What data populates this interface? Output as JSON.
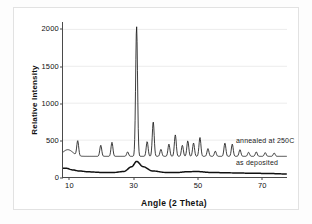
{
  "chart_data": {
    "type": "line",
    "title": "",
    "xlabel": "Angle (2 Theta)",
    "ylabel": "Relative Intensity",
    "xlim": [
      8,
      78
    ],
    "ylim": [
      0,
      2100
    ],
    "xticks": [
      10,
      30,
      50,
      70
    ],
    "yticks": [
      0,
      500,
      1000,
      1500,
      2000
    ],
    "grid": "horizontal-faint",
    "legend_position": "inline-right-annotations",
    "series": [
      {
        "name": "annealed at 250C",
        "baseline": 280,
        "color": "#1a1a1a",
        "peaks": [
          {
            "x": 12.6,
            "height": 200
          },
          {
            "x": 19.8,
            "height": 150
          },
          {
            "x": 23.3,
            "height": 190
          },
          {
            "x": 28.2,
            "height": 60
          },
          {
            "x": 31.0,
            "height": 1760
          },
          {
            "x": 34.3,
            "height": 200
          },
          {
            "x": 36.2,
            "height": 470
          },
          {
            "x": 38.6,
            "height": 95
          },
          {
            "x": 41.1,
            "height": 165
          },
          {
            "x": 43.1,
            "height": 290
          },
          {
            "x": 45.3,
            "height": 150
          },
          {
            "x": 47.0,
            "height": 210
          },
          {
            "x": 48.8,
            "height": 180
          },
          {
            "x": 50.8,
            "height": 255
          },
          {
            "x": 53.3,
            "height": 105
          },
          {
            "x": 55.6,
            "height": 70
          },
          {
            "x": 58.6,
            "height": 180
          },
          {
            "x": 60.9,
            "height": 165
          },
          {
            "x": 63.3,
            "height": 90
          },
          {
            "x": 66.0,
            "height": 55
          },
          {
            "x": 68.4,
            "height": 60
          },
          {
            "x": 71.2,
            "height": 50
          },
          {
            "x": 74.0,
            "height": 45
          }
        ]
      },
      {
        "name": "as deposited",
        "baseline": 55,
        "color": "#111111",
        "broad_hump": {
          "center": 31.0,
          "height": 160,
          "width": 7.5
        },
        "points": [
          {
            "x": 9.0,
            "y": 118
          },
          {
            "x": 11.0,
            "y": 96
          },
          {
            "x": 13.0,
            "y": 82
          },
          {
            "x": 16.0,
            "y": 70
          },
          {
            "x": 20.0,
            "y": 62
          },
          {
            "x": 24.0,
            "y": 62
          },
          {
            "x": 27.0,
            "y": 75
          },
          {
            "x": 29.5,
            "y": 140
          },
          {
            "x": 31.0,
            "y": 212
          },
          {
            "x": 33.0,
            "y": 140
          },
          {
            "x": 36.0,
            "y": 82
          },
          {
            "x": 40.0,
            "y": 62
          },
          {
            "x": 44.0,
            "y": 62
          },
          {
            "x": 47.0,
            "y": 72
          },
          {
            "x": 50.0,
            "y": 74
          },
          {
            "x": 54.0,
            "y": 62
          },
          {
            "x": 60.0,
            "y": 56
          },
          {
            "x": 66.0,
            "y": 52
          },
          {
            "x": 72.0,
            "y": 48
          },
          {
            "x": 77.0,
            "y": 42
          }
        ]
      }
    ],
    "annotations": [
      {
        "text": "annealed at 250C",
        "series": "annealed at 250C"
      },
      {
        "text": "as deposited",
        "series": "as deposited"
      }
    ]
  }
}
